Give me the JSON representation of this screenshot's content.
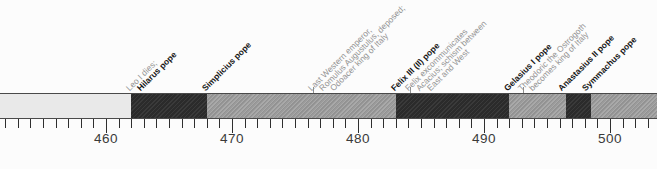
{
  "figure_title": "Timeline of popes and events in Italy, AD 452-503",
  "colors": {
    "background": "#fcfcfc",
    "segment_light": "#e9e9e9",
    "segment_medium": "#9b9b9b",
    "segment_dark": "#2b2b2b",
    "bar_border": "#4a4a4a",
    "axis_tick": "#2f2f2f",
    "axis_label_text": "#3a3a3a",
    "event_text_gray": "#949494",
    "pope_text_black": "#151515"
  },
  "timeline": {
    "axis": {
      "start_year": 451.5,
      "end_year": 503.7,
      "minor_tick_interval_years": 1,
      "major_ticks": [
        {
          "year": 460,
          "label": "460"
        },
        {
          "year": 470,
          "label": "470"
        },
        {
          "year": 480,
          "label": "480"
        },
        {
          "year": 490,
          "label": "490"
        },
        {
          "year": 500,
          "label": "500"
        }
      ]
    },
    "segments": [
      {
        "start": 451.5,
        "end": 462,
        "shade": "light",
        "pope": ""
      },
      {
        "start": 462,
        "end": 468,
        "shade": "dark",
        "pope": "Hilarus"
      },
      {
        "start": 468,
        "end": 483,
        "shade": "medium",
        "pope": "Simplicius"
      },
      {
        "start": 483,
        "end": 492,
        "shade": "dark",
        "pope": "Felix III (II)"
      },
      {
        "start": 492,
        "end": 496.5,
        "shade": "medium",
        "pope": "Gelasius I"
      },
      {
        "start": 496.5,
        "end": 498.5,
        "shade": "dark",
        "pope": "Anastasius II"
      },
      {
        "start": 498.5,
        "end": 503.7,
        "shade": "medium",
        "pope": "Symmachus"
      }
    ],
    "annotations": [
      {
        "year": 462,
        "tick": false,
        "lines": [
          {
            "text": "Leo I dies;",
            "bold": false
          },
          {
            "text": "Hilarus pope",
            "bold": true
          }
        ]
      },
      {
        "year": 468,
        "tick": false,
        "lines": [
          {
            "text": "Simplicius pope",
            "bold": true
          }
        ]
      },
      {
        "year": 476.4,
        "tick": true,
        "lines": [
          {
            "text": "Last Western emperor,",
            "bold": false
          },
          {
            "text": "Romulus Augustulus, deposed;",
            "bold": false
          },
          {
            "text": "Odoacer king of Italy",
            "bold": false
          }
        ]
      },
      {
        "year": 483,
        "tick": false,
        "lines": [
          {
            "text": "Felix III (II) pope",
            "bold": true
          }
        ]
      },
      {
        "year": 484.1,
        "tick": true,
        "lines": [
          {
            "text": "Felix excommunicates",
            "bold": false
          },
          {
            "text": "Acacius; schism between",
            "bold": false
          },
          {
            "text": "East and West",
            "bold": false
          }
        ]
      },
      {
        "year": 492,
        "tick": false,
        "lines": [
          {
            "text": "Gelasius I pope",
            "bold": true
          }
        ]
      },
      {
        "year": 493.1,
        "tick": true,
        "lines": [
          {
            "text": "Theodoric the Ostrogoth",
            "bold": false
          },
          {
            "text": "becomes king of Italy",
            "bold": false
          }
        ]
      },
      {
        "year": 496.3,
        "tick": false,
        "lines": [
          {
            "text": "Anastasius II pope",
            "bold": true
          }
        ]
      },
      {
        "year": 498.2,
        "tick": false,
        "lines": [
          {
            "text": "Symmachus pope",
            "bold": true
          }
        ]
      }
    ]
  }
}
